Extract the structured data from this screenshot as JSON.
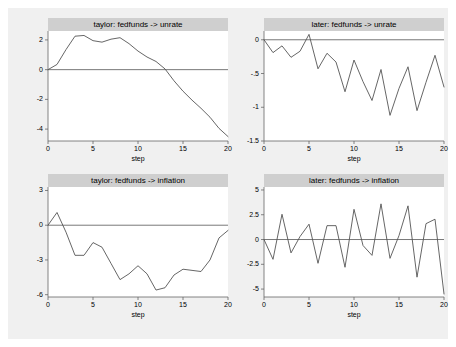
{
  "figure": {
    "background_color": "#f0f0f0",
    "plot_background_color": "#ffffff",
    "title_bar_color": "#cfcfcf",
    "line_color": "#555555",
    "axis_color": "#666666"
  },
  "chart_data": [
    {
      "type": "line",
      "panel": "top-left",
      "title": "taylor: fedfunds -> unrate",
      "xlabel": "step",
      "ylabel": "",
      "xlim": [
        0,
        20
      ],
      "ylim": [
        -4.8,
        2.6
      ],
      "xticks": [
        0,
        5,
        10,
        15,
        20
      ],
      "xticklabels": [
        "0",
        "5",
        "10",
        "15",
        "20"
      ],
      "yticks": [
        2,
        0,
        -2,
        -4
      ],
      "yticklabels": [
        "2",
        "0",
        "-2",
        "-4"
      ],
      "grid": false,
      "zero_line": true,
      "x": [
        0,
        1,
        2,
        3,
        4,
        5,
        6,
        7,
        8,
        9,
        10,
        11,
        12,
        13,
        14,
        15,
        16,
        17,
        18,
        19,
        20
      ],
      "values": [
        0.0,
        0.35,
        1.35,
        2.25,
        2.3,
        1.95,
        1.85,
        2.05,
        2.15,
        1.75,
        1.25,
        0.85,
        0.55,
        0.05,
        -0.75,
        -1.45,
        -2.05,
        -2.6,
        -3.2,
        -3.95,
        -4.5
      ]
    },
    {
      "type": "line",
      "panel": "top-right",
      "title": "later: fedfunds -> unrate",
      "xlabel": "step",
      "ylabel": "",
      "xlim": [
        0,
        20
      ],
      "ylim": [
        -1.5,
        0.13
      ],
      "xticks": [
        0,
        5,
        10,
        15,
        20
      ],
      "xticklabels": [
        "0",
        "5",
        "10",
        "15",
        "20"
      ],
      "yticks": [
        0,
        -0.5,
        -1,
        -1.5
      ],
      "yticklabels": [
        "0",
        "-.5",
        "-1",
        "-1.5"
      ],
      "grid": false,
      "zero_line": true,
      "x": [
        0,
        1,
        2,
        3,
        4,
        5,
        6,
        7,
        8,
        9,
        10,
        11,
        12,
        13,
        14,
        15,
        16,
        17,
        18,
        19,
        20
      ],
      "values": [
        0.0,
        -0.19,
        -0.09,
        -0.26,
        -0.17,
        0.08,
        -0.43,
        -0.2,
        -0.33,
        -0.77,
        -0.3,
        -0.62,
        -0.9,
        -0.44,
        -1.12,
        -0.72,
        -0.4,
        -1.05,
        -0.63,
        -0.23,
        -0.7
      ]
    },
    {
      "type": "line",
      "panel": "bottom-left",
      "title": "taylor: fedfunds -> inflation",
      "xlabel": "step",
      "ylabel": "",
      "xlim": [
        0,
        20
      ],
      "ylim": [
        -6.2,
        3.3
      ],
      "xticks": [
        0,
        5,
        10,
        15,
        20
      ],
      "xticklabels": [
        "0",
        "5",
        "10",
        "15",
        "20"
      ],
      "yticks": [
        3,
        0,
        -3,
        -6
      ],
      "yticklabels": [
        "3",
        "0",
        "-3",
        "-6"
      ],
      "grid": false,
      "zero_line": true,
      "x": [
        0,
        1,
        2,
        3,
        4,
        5,
        6,
        7,
        8,
        9,
        10,
        11,
        12,
        13,
        14,
        15,
        16,
        17,
        18,
        19,
        20
      ],
      "values": [
        0.0,
        1.1,
        -0.6,
        -2.6,
        -2.6,
        -1.5,
        -1.9,
        -3.3,
        -4.7,
        -4.2,
        -3.5,
        -4.2,
        -5.6,
        -5.4,
        -4.3,
        -3.8,
        -3.9,
        -4.0,
        -3.0,
        -1.1,
        -0.45
      ]
    },
    {
      "type": "line",
      "panel": "bottom-right",
      "title": "later: fedfunds -> inflation",
      "xlabel": "step",
      "ylabel": "",
      "xlim": [
        0,
        20
      ],
      "ylim": [
        -5.8,
        5.3
      ],
      "xticks": [
        0,
        5,
        10,
        15,
        20
      ],
      "xticklabels": [
        "0",
        "5",
        "10",
        "15",
        "20"
      ],
      "yticks": [
        5,
        2.5,
        0,
        -2.5,
        -5
      ],
      "yticklabels": [
        "5",
        "2.5",
        "0",
        "-2.5",
        "-5"
      ],
      "grid": false,
      "zero_line": true,
      "x": [
        0,
        1,
        2,
        3,
        4,
        5,
        6,
        7,
        8,
        9,
        10,
        11,
        12,
        13,
        14,
        15,
        16,
        17,
        18,
        19,
        20
      ],
      "values": [
        0.0,
        -2.0,
        2.55,
        -1.35,
        0.3,
        1.55,
        -2.4,
        1.4,
        1.4,
        -2.8,
        3.05,
        -0.6,
        -1.6,
        3.6,
        -1.9,
        0.4,
        3.4,
        -3.8,
        1.6,
        2.05,
        -5.5
      ]
    }
  ]
}
